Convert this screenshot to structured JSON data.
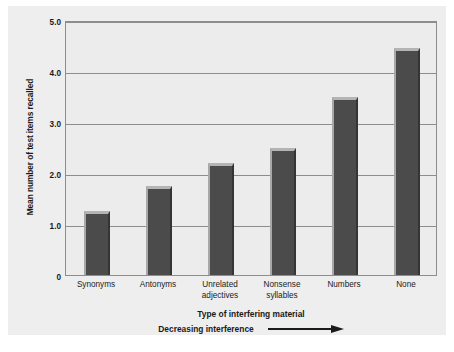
{
  "chart_data": {
    "type": "bar",
    "title": "",
    "categories": [
      "Synonyms",
      "Antonyms",
      "Unrelated adjectives",
      "Nonsense syllables",
      "Numbers",
      "None"
    ],
    "category_lines": [
      [
        "Synonyms"
      ],
      [
        "Antonyms"
      ],
      [
        "Unrelated",
        "adjectives"
      ],
      [
        "Nonsense",
        "syllables"
      ],
      [
        "Numbers"
      ],
      [
        "None"
      ]
    ],
    "values": [
      1.25,
      1.75,
      2.2,
      2.5,
      3.5,
      4.45
    ],
    "xlabel": "Type of interfering material",
    "ylabel": "Mean number of test items recalled",
    "ylim": [
      0,
      5
    ],
    "yticks": [
      "0",
      "1.0",
      "2.0",
      "3.0",
      "4.0",
      "5.0"
    ],
    "ytick_values": [
      0,
      1,
      2,
      3,
      4,
      5
    ],
    "grid": true,
    "legend": "none",
    "annotation": "Decreasing interference",
    "annotation_arrow": "right-arrow"
  },
  "colors": {
    "bar_face": "#4b4b4b",
    "bar_top_highlight": "#b4b4b4",
    "plot_background": "#ececec",
    "figure_background": "#eeeeee",
    "gridline": "#8d8d8d",
    "text": "#1a1a1a"
  }
}
